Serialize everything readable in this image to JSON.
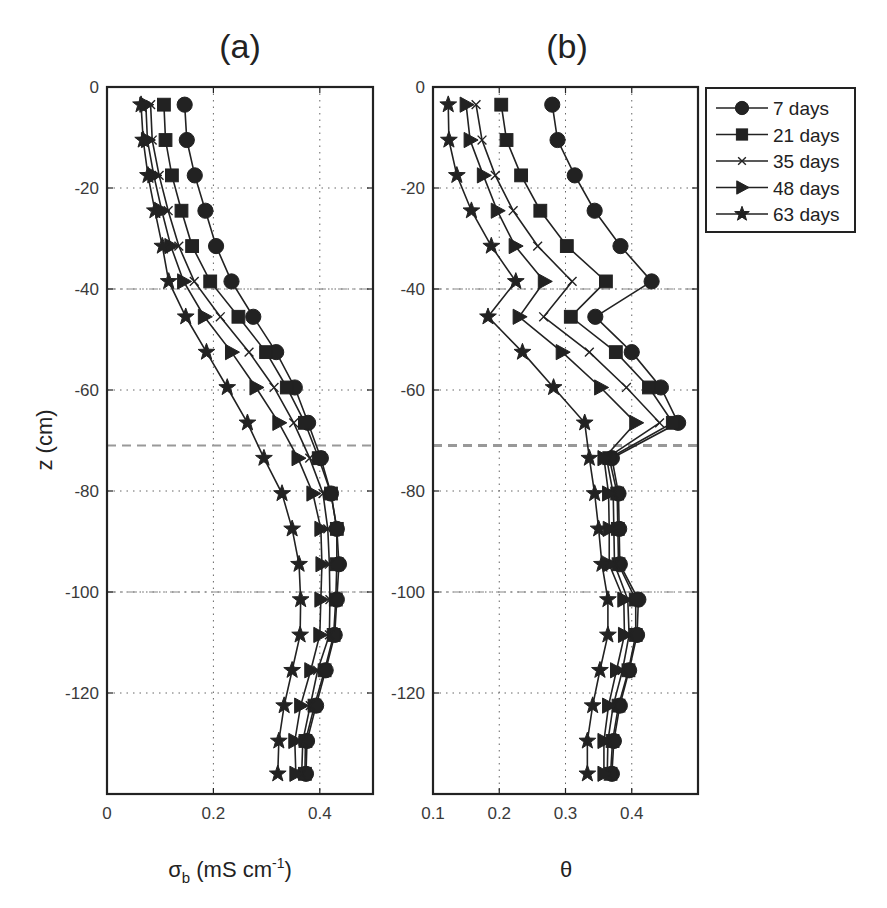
{
  "chart_data": [
    {
      "type": "line",
      "panel": "(a)",
      "title": "(a)",
      "xlabel": "σb (mS cm-1)",
      "xlabel_parts": {
        "symbol": "σ",
        "sub": "b",
        "rest": " (mS cm",
        "sup": "-1",
        "close": ")"
      },
      "ylabel": "z (cm)",
      "xlim": [
        0,
        0.5
      ],
      "ylim": [
        -140,
        0
      ],
      "xticks": [
        0,
        0.2,
        0.4
      ],
      "xtick_labels": [
        "0",
        "0.2",
        "0.4"
      ],
      "yticks": [
        0,
        -20,
        -40,
        -60,
        -80,
        -100,
        -120
      ],
      "ytick_labels": [
        "0",
        "-20",
        "-40",
        "-60",
        "-80",
        "-100",
        "-120"
      ],
      "grid": true,
      "reference_lines": [
        {
          "z": -40,
          "style": "dash-dot"
        },
        {
          "z": -71,
          "style": "dashed"
        },
        {
          "z": -100,
          "style": "dash-dot"
        }
      ],
      "z": [
        -3.5,
        -10.5,
        -17.5,
        -24.5,
        -31.5,
        -38.5,
        -45.5,
        -52.5,
        -59.5,
        -66.5,
        -73.5,
        -80.5,
        -87.5,
        -94.5,
        -101.5,
        -108.5,
        -115.5,
        -122.5,
        -129.5,
        -136
      ],
      "series": [
        {
          "name": "7 days",
          "marker": "circle",
          "values": [
            0.146,
            0.15,
            0.165,
            0.185,
            0.205,
            0.234,
            0.275,
            0.318,
            0.353,
            0.378,
            0.402,
            0.421,
            0.432,
            0.436,
            0.432,
            0.428,
            0.411,
            0.393,
            0.376,
            0.374
          ]
        },
        {
          "name": "21 days",
          "marker": "square",
          "values": [
            0.107,
            0.11,
            0.122,
            0.14,
            0.16,
            0.194,
            0.247,
            0.299,
            0.338,
            0.372,
            0.398,
            0.421,
            0.432,
            0.432,
            0.43,
            0.426,
            0.409,
            0.39,
            0.373,
            0.372
          ]
        },
        {
          "name": "35 days",
          "marker": "x",
          "values": [
            0.082,
            0.085,
            0.098,
            0.115,
            0.135,
            0.164,
            0.213,
            0.267,
            0.314,
            0.351,
            0.381,
            0.406,
            0.415,
            0.418,
            0.419,
            0.418,
            0.396,
            0.382,
            0.368,
            0.366
          ]
        },
        {
          "name": "48 days",
          "marker": "triangle-right",
          "values": [
            0.073,
            0.076,
            0.088,
            0.103,
            0.12,
            0.144,
            0.183,
            0.234,
            0.28,
            0.323,
            0.359,
            0.387,
            0.402,
            0.404,
            0.402,
            0.4,
            0.383,
            0.364,
            0.353,
            0.355
          ]
        },
        {
          "name": "63 days",
          "marker": "star",
          "values": [
            0.064,
            0.068,
            0.077,
            0.09,
            0.104,
            0.116,
            0.148,
            0.187,
            0.226,
            0.264,
            0.295,
            0.329,
            0.348,
            0.361,
            0.364,
            0.363,
            0.348,
            0.333,
            0.323,
            0.321
          ]
        }
      ]
    },
    {
      "type": "line",
      "panel": "(b)",
      "title": "(b)",
      "xlabel": "θ",
      "ylabel": "",
      "xlim": [
        0.1,
        0.5
      ],
      "ylim": [
        -140,
        0
      ],
      "xticks": [
        0.1,
        0.2,
        0.3,
        0.4
      ],
      "xtick_labels": [
        "0.1",
        "0.2",
        "0.3",
        "0.4"
      ],
      "yticks": [
        0,
        -20,
        -40,
        -60,
        -80,
        -100,
        -120
      ],
      "ytick_labels": [
        "0",
        "-20",
        "-40",
        "-60",
        "-80",
        "-100",
        "-120"
      ],
      "grid": true,
      "reference_lines": [
        {
          "z": -40,
          "style": "dash-dot"
        },
        {
          "z": -71,
          "style": "dashed-thick"
        },
        {
          "z": -100,
          "style": "dash-dot"
        }
      ],
      "z": [
        -3.5,
        -10.5,
        -17.5,
        -24.5,
        -31.5,
        -38.5,
        -45.5,
        -52.5,
        -59.5,
        -66.5,
        -73.5,
        -80.5,
        -87.5,
        -94.5,
        -101.5,
        -108.5,
        -115.5,
        -122.5,
        -129.5,
        -136
      ],
      "series": [
        {
          "name": "7 days",
          "marker": "circle",
          "values": [
            0.28,
            0.288,
            0.314,
            0.344,
            0.383,
            0.43,
            0.345,
            0.4,
            0.444,
            0.47,
            0.37,
            0.38,
            0.381,
            0.382,
            0.41,
            0.408,
            0.396,
            0.382,
            0.373,
            0.37
          ]
        },
        {
          "name": "21 days",
          "marker": "square",
          "values": [
            0.203,
            0.211,
            0.233,
            0.262,
            0.302,
            0.361,
            0.308,
            0.376,
            0.426,
            0.462,
            0.366,
            0.378,
            0.379,
            0.38,
            0.406,
            0.406,
            0.395,
            0.38,
            0.371,
            0.368
          ]
        },
        {
          "name": "35 days",
          "marker": "x",
          "values": [
            0.165,
            0.174,
            0.194,
            0.221,
            0.258,
            0.31,
            0.267,
            0.336,
            0.392,
            0.442,
            0.362,
            0.372,
            0.373,
            0.374,
            0.394,
            0.396,
            0.386,
            0.372,
            0.364,
            0.363
          ]
        },
        {
          "name": "48 days",
          "marker": "triangle-right",
          "values": [
            0.15,
            0.156,
            0.176,
            0.197,
            0.224,
            0.268,
            0.23,
            0.295,
            0.353,
            0.406,
            0.358,
            0.365,
            0.366,
            0.366,
            0.388,
            0.389,
            0.377,
            0.365,
            0.358,
            0.358
          ]
        },
        {
          "name": "63 days",
          "marker": "star",
          "values": [
            0.123,
            0.124,
            0.136,
            0.158,
            0.188,
            0.225,
            0.183,
            0.235,
            0.282,
            0.329,
            0.336,
            0.344,
            0.35,
            0.355,
            0.364,
            0.364,
            0.352,
            0.341,
            0.333,
            0.333
          ]
        }
      ]
    }
  ],
  "legend": {
    "placement": "right of panel (b), top",
    "entries": [
      {
        "label": "7 days",
        "marker": "circle"
      },
      {
        "label": "21 days",
        "marker": "square"
      },
      {
        "label": "35 days",
        "marker": "x"
      },
      {
        "label": "48 days",
        "marker": "triangle-right"
      },
      {
        "label": "63 days",
        "marker": "star"
      }
    ]
  },
  "colors": {
    "ink": "#222222",
    "grid": "#666666",
    "reference": "#999999",
    "background": "#ffffff"
  }
}
